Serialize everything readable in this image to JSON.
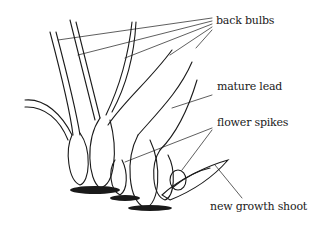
{
  "diagram": {
    "labels": {
      "back_bulbs": "back bulbs",
      "mature_lead": "mature lead",
      "flower_spikes": "flower spikes",
      "new_growth_shoot": "new growth shoot"
    },
    "colors": {
      "ink": "#1a1a1a",
      "background": "#ffffff"
    }
  }
}
